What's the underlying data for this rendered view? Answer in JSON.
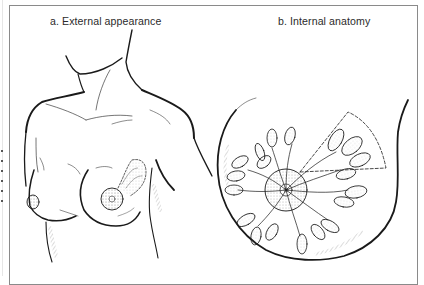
{
  "figure": {
    "panels": [
      {
        "id": "a",
        "label": "a. External appearance",
        "subject": "female torso front view",
        "highlighted_region": "left breast upper-outer quadrant (dashed outline, stippled)"
      },
      {
        "id": "b",
        "label": "b. Internal anatomy",
        "subject": "breast cross-section",
        "structures": [
          "lobules",
          "ducts",
          "areola/nipple",
          "dashed wedge (upper-outer quadrant)"
        ]
      }
    ],
    "colors": {
      "line": "#1a1a1a",
      "frame": "#8a8a8a",
      "stipple": "#9a9a9a",
      "background": "#ffffff"
    }
  }
}
